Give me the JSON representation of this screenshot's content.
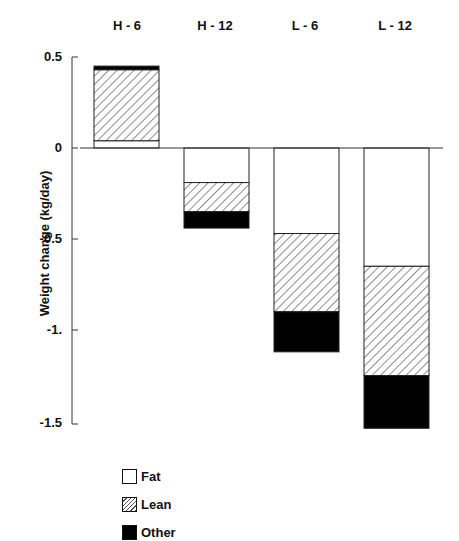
{
  "chart_data": {
    "type": "bar",
    "stacked": true,
    "title": "",
    "xlabel": "",
    "ylabel": "Weight change (kg/day)",
    "categories": [
      "H - 6",
      "H - 12",
      "L - 6",
      "L - 12"
    ],
    "series": [
      {
        "name": "Fat",
        "pattern": "white",
        "values": [
          0.04,
          -0.19,
          -0.47,
          -0.65
        ]
      },
      {
        "name": "Lean",
        "pattern": "hatched",
        "values": [
          0.39,
          -0.16,
          -0.43,
          -0.6
        ]
      },
      {
        "name": "Other",
        "pattern": "black",
        "values": [
          0.02,
          -0.09,
          -0.22,
          -0.29
        ]
      }
    ],
    "totals": [
      0.45,
      -0.44,
      -1.12,
      -1.54
    ],
    "yticks": [
      "0.5",
      "0",
      "-0.5",
      "-1.",
      "-1.5"
    ],
    "ylim": [
      -1.5,
      0.5
    ],
    "grid": false,
    "legend_position": "bottom-left"
  },
  "legend": {
    "items": [
      {
        "label": "Fat"
      },
      {
        "label": "Lean"
      },
      {
        "label": "Other"
      }
    ]
  },
  "axis": {
    "ylabel": "Weight change (kg/day)",
    "ticks": [
      "0.5",
      "0",
      "-0.5",
      "-1.",
      "-1.5"
    ]
  },
  "categories": [
    "H - 6",
    "H - 12",
    "L - 6",
    "L - 12"
  ]
}
